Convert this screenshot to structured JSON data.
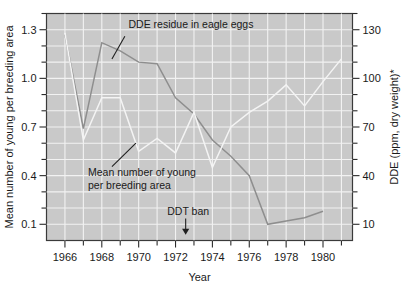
{
  "chart_data": {
    "type": "line",
    "title": "",
    "xlabel": "Year",
    "ylabel": "Mean number of young per breeding area",
    "ylabel_right": "DDE (ppm, dry weight)*",
    "grid": true,
    "legend_position": "inline-annotations",
    "xlim": [
      1965.0,
      1981.6
    ],
    "xticks_major": [
      1966,
      1968,
      1970,
      1972,
      1974,
      1976,
      1978,
      1980
    ],
    "xticks_minor": [
      1967,
      1969,
      1971,
      1973,
      1975,
      1977,
      1979,
      1981
    ],
    "xtick_labels": [
      "1966",
      "1968",
      "1970",
      "1972",
      "1974",
      "1976",
      "1978",
      "1980"
    ],
    "ylim": [
      0.0,
      1.4
    ],
    "yticks_major": [
      0.1,
      0.4,
      0.7,
      1.0,
      1.3
    ],
    "ytick_labels": [
      "0.1",
      "0.4",
      "0.7",
      "1.0",
      "1.3"
    ],
    "yticks_minor": [
      0.2,
      0.3,
      0.5,
      0.6,
      0.8,
      0.9,
      1.1,
      1.2,
      1.4
    ],
    "ylim_right": [
      0,
      140
    ],
    "yticks_major_right": [
      10,
      40,
      70,
      100,
      130
    ],
    "ytick_labels_right": [
      "10",
      "40",
      "70",
      "100",
      "130"
    ],
    "yticks_minor_right": [
      20,
      30,
      50,
      60,
      80,
      90,
      110,
      120,
      140
    ],
    "series": [
      {
        "name": "Mean number of young per breeding area",
        "axis": "left",
        "color": "#f4f4f4",
        "x": [
          1966,
          1967,
          1968,
          1969,
          1970,
          1971,
          1972,
          1973,
          1974,
          1975,
          1976,
          1977,
          1978,
          1979,
          1980,
          1981
        ],
        "values": [
          1.28,
          0.62,
          0.88,
          0.88,
          0.55,
          0.63,
          0.54,
          0.79,
          0.45,
          0.7,
          0.79,
          0.86,
          0.96,
          0.83,
          0.98,
          1.12
        ]
      },
      {
        "name": "DDE residue in eagle eggs",
        "axis": "right",
        "color": "#8e8e8e",
        "x": [
          1966,
          1967,
          1968,
          1969,
          1970,
          1971,
          1972,
          1973,
          1974,
          1975,
          1976,
          1977,
          1978,
          1979,
          1980
        ],
        "values": [
          127,
          69,
          122,
          117,
          110,
          109,
          88,
          78,
          62,
          52,
          40,
          10,
          12,
          14,
          18
        ]
      }
    ],
    "annotations": [
      {
        "id": "dde-annotation",
        "text": "DDE residue in eagle eggs",
        "text_x": 1969.45,
        "text_y_right": 131,
        "leader_from": [
          1969.25,
          126
        ],
        "leader_to": [
          1968.55,
          112
        ]
      },
      {
        "id": "young-annotation",
        "line1": "Mean number of young",
        "line2": "per breeding area",
        "text_x": 1967.25,
        "text_y": 0.4,
        "leader_from": [
          1968.55,
          0.455
        ],
        "leader_to": [
          1969.85,
          0.6
        ]
      },
      {
        "id": "ddt-ban-annotation",
        "text": "DDT ban",
        "text_x": 1971.55,
        "text_y": 0.155,
        "arrow_x": 1972.55,
        "arrow_y_top": 0.135,
        "arrow_y_bottom": 0.035
      }
    ]
  },
  "colors": {
    "plot_background": "#c9c9c9",
    "grid": "#f2f2f2",
    "frame": "#3a3a3a",
    "text": "#1a1a1a",
    "series_young": "#f4f4f4",
    "series_dde": "#8e8e8e",
    "page_background": "#ffffff"
  }
}
